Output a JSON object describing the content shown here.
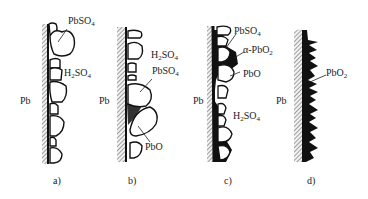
{
  "panels": [
    {
      "caption": "a)",
      "metal": "Pb",
      "labels": [
        {
          "text": "PbSO",
          "sub": "4"
        },
        {
          "text": "H",
          "sub": "2",
          "text2": "SO",
          "sub2": "4"
        }
      ]
    },
    {
      "caption": "b)",
      "metal": "Pb",
      "labels": [
        {
          "text": "H",
          "sub": "2",
          "text2": "SO",
          "sub2": "4"
        },
        {
          "text": "PbSO",
          "sub": "4"
        },
        {
          "text": "PbO"
        }
      ]
    },
    {
      "caption": "c)",
      "metal": "Pb",
      "labels": [
        {
          "text": "PbSO",
          "sub": "4"
        },
        {
          "text": "α-PbO",
          "sub": "2"
        },
        {
          "text": "PbO"
        },
        {
          "text": "H",
          "sub": "2",
          "text2": "SO",
          "sub2": "4"
        }
      ]
    },
    {
      "caption": "d)",
      "metal": "Pb",
      "labels": [
        {
          "text": "PbO",
          "sub": "2"
        }
      ]
    }
  ]
}
